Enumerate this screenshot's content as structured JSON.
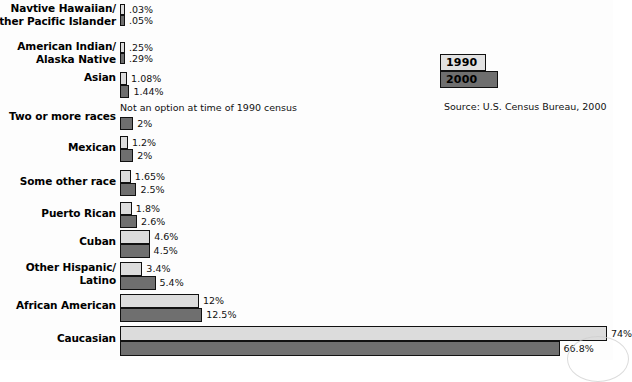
{
  "chart_data": {
    "type": "bar",
    "orientation": "horizontal",
    "title": "",
    "xlabel": "",
    "ylabel": "",
    "xlim": [
      0,
      75
    ],
    "grid": false,
    "legend_position": "top-right",
    "categories": [
      "Navtive Hawaiian/\nOther Pacific Islander",
      "American Indian/\nAlaska Native",
      "Asian",
      "Two or more races",
      "Mexican",
      "Some other race",
      "Puerto Rican",
      "Cuban",
      "Other Hispanic/\nLatino",
      "African American",
      "Caucasian"
    ],
    "series": [
      {
        "name": "1990",
        "color": "#dcdcdc",
        "values": [
          0.03,
          0.25,
          1.08,
          null,
          1.2,
          1.65,
          1.8,
          4.6,
          3.4,
          12,
          74
        ],
        "labels": [
          ".03%",
          ".25%",
          "1.08%",
          "Not an option at time of 1990 census",
          "1.2%",
          "1.65%",
          "1.8%",
          "4.6%",
          "3.4%",
          "12%",
          "74%"
        ]
      },
      {
        "name": "2000",
        "color": "#6f6f6f",
        "values": [
          0.05,
          0.29,
          1.44,
          2,
          2,
          2.5,
          2.6,
          4.5,
          5.4,
          12.5,
          66.8
        ],
        "labels": [
          ".05%",
          ".29%",
          "1.44%",
          "2%",
          "2%",
          "2.5%",
          "2.6%",
          "4.5%",
          "5.4%",
          "12.5%",
          "66.8%"
        ]
      }
    ],
    "annotations": [
      "Not an option at time of 1990 census"
    ],
    "source": "Source: U.S. Census Bureau, 2000"
  },
  "legend": {
    "items": [
      {
        "label": "1990",
        "color": "#dcdcdc"
      },
      {
        "label": "2000",
        "color": "#6f6f6f"
      }
    ]
  },
  "source_note": "Source: U.S. Census Bureau, 2000",
  "rows": [
    {
      "label_line1": "Navtive Hawaiian/",
      "label_line2": "Other Pacific Islander",
      "v1990": ".03%",
      "v2000": ".05%"
    },
    {
      "label_line1": "American Indian/",
      "label_line2": "Alaska Native",
      "v1990": ".25%",
      "v2000": ".29%"
    },
    {
      "label_line1": "Asian",
      "label_line2": "",
      "v1990": "1.08%",
      "v2000": "1.44%"
    },
    {
      "label_line1": "Two or more races",
      "label_line2": "",
      "v1990": "Not an option at time of 1990 census",
      "v2000": "2%"
    },
    {
      "label_line1": "Mexican",
      "label_line2": "",
      "v1990": "1.2%",
      "v2000": "2%"
    },
    {
      "label_line1": "Some other race",
      "label_line2": "",
      "v1990": "1.65%",
      "v2000": "2.5%"
    },
    {
      "label_line1": "Puerto Rican",
      "label_line2": "",
      "v1990": "1.8%",
      "v2000": "2.6%"
    },
    {
      "label_line1": "Cuban",
      "label_line2": "",
      "v1990": "4.6%",
      "v2000": "4.5%"
    },
    {
      "label_line1": "Other Hispanic/",
      "label_line2": "Latino",
      "v1990": "3.4%",
      "v2000": "5.4%"
    },
    {
      "label_line1": "African American",
      "label_line2": "",
      "v1990": "12%",
      "v2000": "12.5%"
    },
    {
      "label_line1": "Caucasian",
      "label_line2": "",
      "v1990": "74%",
      "v2000": "66.8%"
    }
  ]
}
